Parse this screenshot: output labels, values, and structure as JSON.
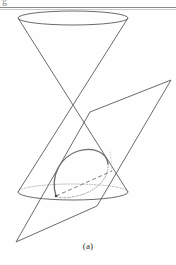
{
  "figure": {
    "caption": "(a)",
    "header_fragment": "g",
    "stroke_color": "#5a5a5a",
    "hidden_stroke_color": "#777777",
    "dotted_stroke_color": "#9a9a9a",
    "background_color": "#fefefe",
    "rule_color": "#8a8a8a"
  },
  "geometry": {
    "top_ellipse": {
      "cx": 73,
      "cy": 18,
      "rx": 55,
      "ry": 7
    },
    "bottom_ellipse": {
      "cx": 73,
      "cy": 192,
      "rx": 55,
      "ry": 8
    },
    "apex": {
      "x": 73,
      "y": 106
    },
    "upper_nappe_left_edge": {
      "x1": 18,
      "y1": 18,
      "x2": 73,
      "y2": 106
    },
    "upper_nappe_right_edge": {
      "x1": 128,
      "y1": 18,
      "x2": 73,
      "y2": 106
    },
    "lower_nappe_left_edge": {
      "x1": 73,
      "y1": 106,
      "x2": 18,
      "y2": 192
    },
    "lower_nappe_right_edge": {
      "x1": 73,
      "y1": 106,
      "x2": 128,
      "y2": 192
    },
    "plane_corners": [
      {
        "x": 90,
        "y": 112
      },
      {
        "x": 171,
        "y": 80
      },
      {
        "x": 97,
        "y": 206
      },
      {
        "x": 16,
        "y": 242
      }
    ],
    "conic_ellipse": {
      "cx": 80,
      "cy": 174,
      "rx": 33,
      "ry": 17,
      "rotation_deg": -39,
      "visible_arc": "front-upper",
      "hidden_arc": "back-lower dashed"
    }
  },
  "labels": {
    "figure_part": "(a)"
  }
}
